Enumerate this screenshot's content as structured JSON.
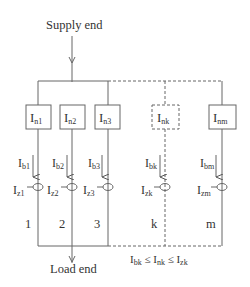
{
  "diagram": {
    "supply_label": "Supply end",
    "load_label": "Load end",
    "condition": {
      "ib": "I",
      "ib_sub": "bk",
      "le1": " ≤ ",
      "in": "I",
      "in_sub": "nk",
      "le2": " ≤ ",
      "iz": "I",
      "iz_sub": "zk"
    },
    "branches": [
      {
        "id": "1",
        "box_main": "I",
        "box_sub": "n1",
        "ib_main": "I",
        "ib_sub": "b1",
        "iz_main": "I",
        "iz_sub": "z1",
        "number": "1",
        "dashed": false
      },
      {
        "id": "2",
        "box_main": "I",
        "box_sub": "n2",
        "ib_main": "I",
        "ib_sub": "b2",
        "iz_main": "I",
        "iz_sub": "z2",
        "number": "2",
        "dashed": false
      },
      {
        "id": "3",
        "box_main": "I",
        "box_sub": "n3",
        "ib_main": "I",
        "ib_sub": "b3",
        "iz_main": "I",
        "iz_sub": "z3",
        "number": "3",
        "dashed": false
      },
      {
        "id": "k",
        "box_main": "I",
        "box_sub": "nk",
        "ib_main": "I",
        "ib_sub": "bk",
        "iz_main": "I",
        "iz_sub": "zk",
        "number": "k",
        "dashed": true
      },
      {
        "id": "m",
        "box_main": "I",
        "box_sub": "nm",
        "ib_main": "I",
        "ib_sub": "bm",
        "iz_main": "I",
        "iz_sub": "zm",
        "number": "m",
        "dashed": false
      }
    ],
    "colors": {
      "line": "#555555",
      "text": "#333333",
      "background": "#ffffff"
    }
  }
}
